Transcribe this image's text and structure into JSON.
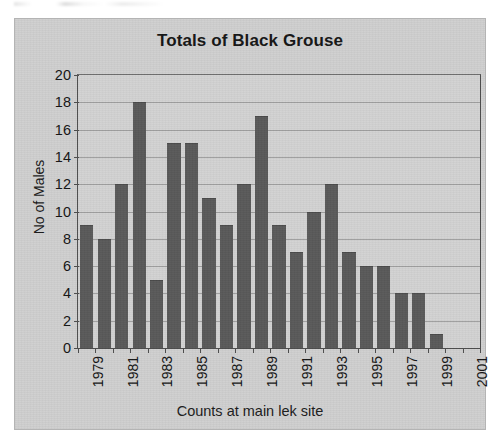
{
  "chart_data": {
    "type": "bar",
    "title": "Totals of Black Grouse",
    "xlabel": "Counts at main lek site",
    "ylabel": "No of Males",
    "categories": [
      "1979",
      "1980",
      "1981",
      "1982",
      "1983",
      "1984",
      "1985",
      "1986",
      "1987",
      "1988",
      "1989",
      "1990",
      "1991",
      "1992",
      "1993",
      "1994",
      "1995",
      "1996",
      "1997",
      "1998",
      "1999",
      "2000",
      "2001"
    ],
    "values": [
      9,
      8,
      12,
      18,
      5,
      15,
      15,
      11,
      9,
      12,
      17,
      9,
      7,
      10,
      12,
      7,
      6,
      6,
      4,
      4,
      1,
      0,
      0
    ],
    "tick_labels": [
      "1979",
      "",
      "1981",
      "",
      "1983",
      "",
      "1985",
      "",
      "1987",
      "",
      "1989",
      "",
      "1991",
      "",
      "1993",
      "",
      "1995",
      "",
      "1997",
      "",
      "1999",
      "",
      "2001"
    ],
    "yticks": [
      0,
      2,
      4,
      6,
      8,
      10,
      12,
      14,
      16,
      18,
      20
    ],
    "ylim": [
      0,
      20
    ],
    "grid": true,
    "legend": false,
    "bar_color": "#595959",
    "plot_background": "#d2d2d2",
    "chart_background": "#cfcfcf",
    "axis_color": "#4d4d4d",
    "gridline_color": "#8e8e8e"
  }
}
